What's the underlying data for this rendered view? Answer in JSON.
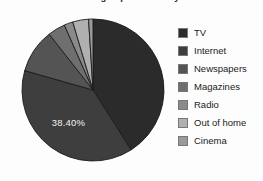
{
  "chart_data": {
    "type": "pie",
    "title": "Advertising expenditure by media",
    "title_clipped": true,
    "categories": [
      "TV",
      "Internet",
      "Newspapers",
      "Magazines",
      "Radio",
      "Out of home",
      "Cinema"
    ],
    "values": [
      41.0,
      38.4,
      10.0,
      4.0,
      2.0,
      3.6,
      1.0
    ],
    "value_unit": "%",
    "visible_labels": [
      {
        "category": "Internet",
        "text": "38.40%"
      }
    ],
    "colors": [
      "#2b2b2b",
      "#3e3e3e",
      "#545454",
      "#6f6f6f",
      "#8a8a8a",
      "#b0b0b0",
      "#9a9a9a"
    ],
    "legend": {
      "position": "right",
      "entries": [
        {
          "label": "TV",
          "color": "#2b2b2b"
        },
        {
          "label": "Internet",
          "color": "#3e3e3e"
        },
        {
          "label": "Newspapers",
          "color": "#545454"
        },
        {
          "label": "Magazines",
          "color": "#6f6f6f"
        },
        {
          "label": "Radio",
          "color": "#8a8a8a"
        },
        {
          "label": "Out of home",
          "color": "#b0b0b0"
        },
        {
          "label": "Cinema",
          "color": "#9a9a9a"
        }
      ]
    },
    "xlabel": "",
    "ylabel": "",
    "grid": false,
    "start_angle_deg": 0,
    "direction": "clockwise",
    "geometry": {
      "cx": 93,
      "cy": 90,
      "r": 71
    }
  }
}
